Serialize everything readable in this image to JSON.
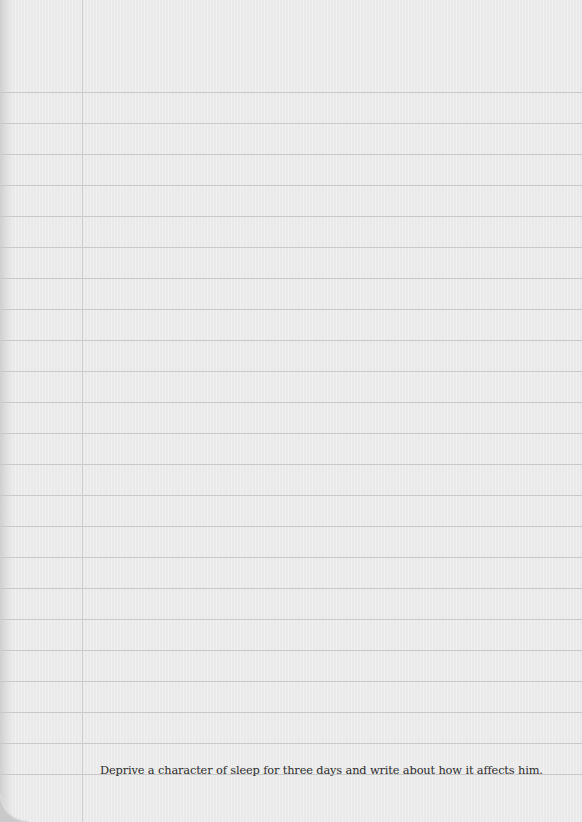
{
  "page": {
    "type": "lined notebook paper",
    "background_color": "#ededed",
    "rule_color": "#c9c9c9",
    "margin_line_color": "#cdcdcd",
    "rule_start_y": 92,
    "rule_spacing": 31,
    "rule_count": 23,
    "margin_line_x": 82
  },
  "prompt": {
    "text": "Deprive a character of sleep for three days and write about how it affects him."
  }
}
